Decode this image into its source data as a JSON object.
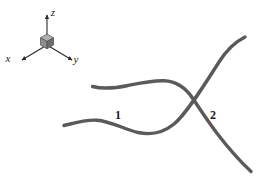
{
  "figure": {
    "background_color": "#ffffff",
    "width": 265,
    "height": 185
  },
  "axis_indicator": {
    "name": "coordinate-axis-triad",
    "origin": {
      "x": 47,
      "y": 45
    },
    "cube": {
      "name": "origin-cube",
      "top_face_color": "#b0b0b0",
      "left_face_color": "#8f8f8f",
      "right_face_color": "#6e6e6e",
      "edge_color": "#4a4a4a",
      "size": 9
    },
    "axes": [
      {
        "label": "z",
        "name": "z-axis",
        "direction": "up",
        "tip": {
          "x": 47,
          "y": 15
        },
        "label_pos": {
          "x": 53,
          "y": 16
        }
      },
      {
        "label": "x",
        "name": "x-axis",
        "direction": "down-left",
        "tip": {
          "x": 22,
          "y": 60
        },
        "label_pos": {
          "x": 8,
          "y": 62
        }
      },
      {
        "label": "y",
        "name": "y-axis",
        "direction": "down-right",
        "tip": {
          "x": 72,
          "y": 60
        },
        "label_pos": {
          "x": 76,
          "y": 63
        }
      }
    ],
    "axis_color": "#2b2b2b"
  },
  "curves": [
    {
      "id": "curve-1",
      "label": "1",
      "name": "curve-one",
      "color": "#5a5a5a",
      "stroke_width": 3.4,
      "description": "upper-left branch sweeping right and down into the crossing, continuing to lower-right",
      "path": "M 92.5 86.5 C 104 89.5 116 88 128 85.5 C 141 82.8 152 80.5 164 80.8 C 176 81.1 186 88 193.5 99.5 C 205 117 224 146 251 171.5",
      "label_pos": {
        "x": 118,
        "y": 119
      }
    },
    {
      "id": "curve-2",
      "label": "2",
      "name": "curve-two",
      "color": "#5a5a5a",
      "stroke_width": 3.4,
      "description": "lower-left branch rising right into the crossing, continuing to upper-right",
      "path": "M 64 125.5 C 76 122.5 86 119.5 97 120.2 C 110 121 125 129.5 138 132.5 C 152 135.5 163 133 174 124 C 186 114.5 205 84 219 62 C 227 49.5 236 41.5 245 37",
      "label_pos": {
        "x": 213,
        "y": 119
      }
    }
  ],
  "crossing_point": {
    "x": 194,
    "y": 101
  },
  "labels": {
    "curve_1": "1",
    "curve_2": "2",
    "axis_x": "x",
    "axis_y": "y",
    "axis_z": "z"
  }
}
